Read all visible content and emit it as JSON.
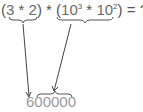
{
  "expression": {
    "open1": "(",
    "a": "3",
    "op1": " * ",
    "b": "2",
    "close1": ")",
    "op_mid": " * ",
    "open2": "(",
    "base1": "10",
    "exp1": "3",
    "op2": " * ",
    "base2": "10",
    "exp2": "2",
    "close2": ")",
    "equals": " = ",
    "unknown": "?"
  },
  "result": {
    "value": "600000"
  },
  "colors": {
    "text": "#555555",
    "result": "#999999",
    "lines": "#444444"
  }
}
